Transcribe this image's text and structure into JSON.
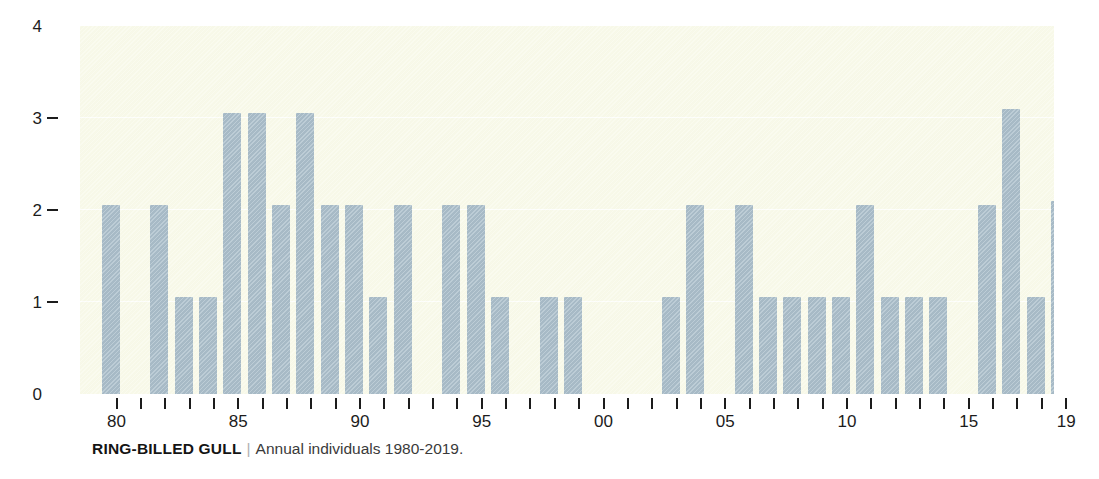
{
  "caption": {
    "species": "RING-BILLED GULL",
    "separator": "|",
    "subtitle": "Annual individuals 1980-2019."
  },
  "colors": {
    "bar": "#acc0cc",
    "panel_background": "#f9faea",
    "gridline": "#ffffff",
    "axis_text": "#1c1c1c",
    "page_background": "#ffffff"
  },
  "chart_data": {
    "type": "bar",
    "title": "RING-BILLED GULL",
    "subtitle": "Annual individuals 1980-2019.",
    "xlabel": "",
    "ylabel": "",
    "ylim": [
      0,
      4
    ],
    "yticks": [
      0,
      1,
      2,
      3,
      4
    ],
    "ytick_labels": [
      "0",
      "1",
      "2",
      "3",
      "4"
    ],
    "grid": "horizontal gridlines at 1, 2, 3",
    "legend": "none",
    "xtick_labels_shown": [
      "80",
      "85",
      "90",
      "95",
      "00",
      "05",
      "10",
      "15",
      "19"
    ],
    "xtick_label_years": [
      1980,
      1985,
      1990,
      1995,
      2000,
      2005,
      2010,
      2015,
      2019
    ],
    "x_minor_ticks": "every year 1980-2019",
    "categories": [
      "1980",
      "1981",
      "1982",
      "1983",
      "1984",
      "1985",
      "1986",
      "1987",
      "1988",
      "1989",
      "1990",
      "1991",
      "1992",
      "1993",
      "1994",
      "1995",
      "1996",
      "1997",
      "1998",
      "1999",
      "2000",
      "2001",
      "2002",
      "2003",
      "2004",
      "2005",
      "2006",
      "2007",
      "2008",
      "2009",
      "2010",
      "2011",
      "2012",
      "2013",
      "2014",
      "2015",
      "2016",
      "2017",
      "2018",
      "2019"
    ],
    "values": [
      2.05,
      0,
      2.05,
      1.05,
      1.05,
      3.05,
      3.05,
      2.05,
      3.05,
      2.05,
      2.05,
      1.05,
      2.05,
      0,
      2.05,
      2.05,
      1.05,
      0,
      1.05,
      1.05,
      0,
      0,
      0,
      1.05,
      2.05,
      0,
      2.05,
      1.05,
      1.05,
      1.05,
      1.05,
      2.05,
      1.05,
      1.05,
      1.05,
      0,
      2.05,
      3.1,
      1.05,
      2.1
    ]
  }
}
